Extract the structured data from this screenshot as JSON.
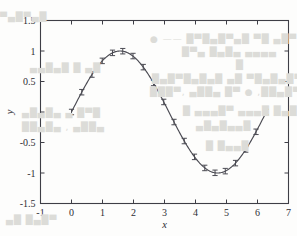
{
  "figure": {
    "background_color": "#fdfdfc",
    "ink_color": "#4a4a52",
    "axis_color": "#3e3e46"
  },
  "bleed_through_text": [
    {
      "text": "● —— █▀█▄█▀▄█ ▀█  ▄█▀  █▄█▀▄█▀",
      "x": 150,
      "y": 34
    },
    {
      "text": "█▀▄ █▄█▄  ▄▄▄▄",
      "x": 182,
      "y": 47
    },
    {
      "text": "█",
      "x": 236,
      "y": 60
    },
    {
      "text": "█▄█▀█▄█▄█  ▄█  ▀█▄█▄█▀█",
      "x": 152,
      "y": 74
    },
    {
      "text": "███▀, ▄██▄ █▀ ● ,██▄█▀",
      "x": 150,
      "y": 87
    },
    {
      "text": "█ ▄▄▄█▀ ▄▄▄█ █▄█",
      "x": 183,
      "y": 106
    },
    {
      "text": "▄█▄█▄▄█",
      "x": 196,
      "y": 121
    },
    {
      "text": "█ █▄▄█",
      "x": 206,
      "y": 141
    },
    {
      "text": "▄▄█▄█ █ ▄█",
      "x": 30,
      "y": 63
    },
    {
      "text": "▄█▄█▄ ▄ █▀█",
      "x": 22,
      "y": 108
    },
    {
      "text": "██▄█▄ , ▄██▄",
      "x": 22,
      "y": 122
    },
    {
      "text": "▄█ █▄█▀",
      "x": 6,
      "y": 215
    },
    {
      "text": "▀▄█▀▄█",
      "x": 0,
      "y": 12
    }
  ],
  "chart_data": {
    "type": "line",
    "title": "",
    "xlabel": "x",
    "ylabel": "y",
    "xlim": [
      -1,
      7
    ],
    "ylim": [
      -1.5,
      1.5
    ],
    "xticks": [
      -1,
      0,
      1,
      2,
      3,
      4,
      5,
      6,
      7
    ],
    "xticklabels": [
      "-1",
      "0",
      "1",
      "2",
      "3",
      "4",
      "5",
      "6",
      "7"
    ],
    "yticks": [
      -1.5,
      -1,
      -0.5,
      0,
      0.5,
      1,
      1.5
    ],
    "yticklabels": [
      "-1.5",
      "-1",
      "-0.5",
      "0",
      "0.5",
      "1",
      "1.5"
    ],
    "grid": false,
    "legend": null,
    "has_error_bars": true,
    "marker": "errorbar-cap",
    "series": [
      {
        "name": "sin(x)",
        "color": "#4a4a52",
        "x": [
          0.0,
          0.3307,
          0.6614,
          0.9921,
          1.3228,
          1.6535,
          1.9842,
          2.3149,
          2.6456,
          2.9762,
          3.3069,
          3.6376,
          3.9683,
          4.299,
          4.6297,
          4.9604,
          5.2911,
          5.6218,
          5.9525,
          6.2832
        ],
        "y": [
          0.0,
          0.3247,
          0.6142,
          0.838,
          0.9694,
          0.9969,
          0.9171,
          0.7357,
          0.4759,
          0.1646,
          -0.1646,
          -0.4759,
          -0.7357,
          -0.9171,
          -0.9969,
          -0.9694,
          -0.838,
          -0.6142,
          -0.3247,
          0.0
        ],
        "yerr": [
          0.045,
          0.045,
          0.045,
          0.045,
          0.045,
          0.045,
          0.045,
          0.045,
          0.045,
          0.045,
          0.045,
          0.045,
          0.045,
          0.045,
          0.045,
          0.045,
          0.045,
          0.045,
          0.045,
          0.045
        ]
      }
    ]
  }
}
